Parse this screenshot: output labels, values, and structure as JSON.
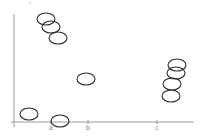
{
  "chart_data": {
    "type": "scatter",
    "title": "",
    "xlabel": "",
    "ylabel": "",
    "grid": false,
    "legend": null,
    "categories": [
      "a",
      "b",
      "c"
    ],
    "marker": "open-ellipse",
    "colors": {
      "marker_stroke": "#2a2a2a",
      "axis": "#9a9a9a",
      "tick_label": "#8a8a8a"
    },
    "points": [
      {
        "x_px": 46,
        "y_px": 19
      },
      {
        "x_px": 51,
        "y_px": 27
      },
      {
        "x_px": 58,
        "y_px": 38
      },
      {
        "x_px": 86,
        "y_px": 79
      },
      {
        "x_px": 29,
        "y_px": 114
      },
      {
        "x_px": 60,
        "y_px": 121
      },
      {
        "x_px": 177,
        "y_px": 65
      },
      {
        "x_px": 176,
        "y_px": 73
      },
      {
        "x_px": 172,
        "y_px": 84
      },
      {
        "x_px": 171,
        "y_px": 96
      }
    ]
  },
  "axes": {
    "x_ticks": [
      {
        "label": "a",
        "x": 51
      },
      {
        "label": "b",
        "x": 88
      },
      {
        "label": "c",
        "x": 157
      }
    ]
  }
}
